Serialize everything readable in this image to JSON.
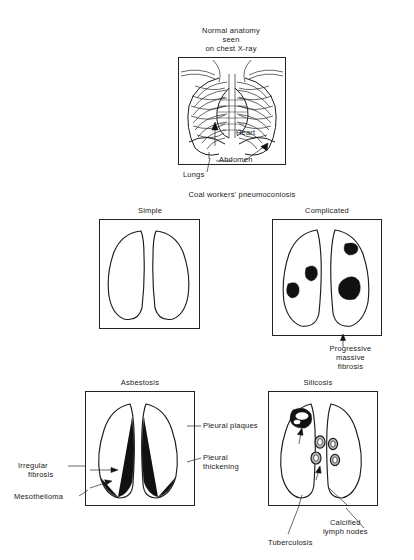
{
  "figure": {
    "domain": "medical-illustration",
    "topic": "Occupational lung disease radiographic appearances",
    "panel_count": 4
  },
  "panels": {
    "normal": {
      "title_line1": "Normal anatomy",
      "title_line2": "seen",
      "title_line3": "on chest X-ray",
      "labels": {
        "heart": "Heart",
        "abdomen": "Abdomen",
        "lungs": "Lungs"
      }
    },
    "coal": {
      "section_title": "Coal workers' pneumoconiosis",
      "simple": {
        "title": "Simple"
      },
      "complicated": {
        "title": "Complicated",
        "caption_line1": "Progressive",
        "caption_line2": "massive",
        "caption_line3": "fibrosis"
      }
    },
    "asbestosis": {
      "title": "Asbestosis",
      "labels": {
        "pleural_plaques": "Pleural plaques",
        "pleural_thickening_line1": "Pleural",
        "pleural_thickening_line2": "thickening",
        "irregular_fibrosis_line1": "Irregular",
        "irregular_fibrosis_line2": "fibrosis",
        "mesothelioma": "Mesothelioma"
      }
    },
    "silicosis": {
      "title": "Silicosis",
      "labels": {
        "calcified_nodes_line1": "Calcified",
        "calcified_nodes_line2": "lymph nodes",
        "tuberculosis": "Tuberculosis"
      }
    }
  },
  "colors": {
    "ink": "#1d1d1d",
    "solid_lesion": "#111111",
    "paper": "#ffffff"
  }
}
